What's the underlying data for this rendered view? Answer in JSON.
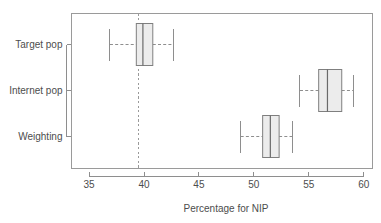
{
  "chart_data": {
    "type": "boxplot",
    "title": "",
    "xlabel": "Percentage for NIP",
    "ylabel": "",
    "orientation": "horizontal",
    "xlim": [
      33.4,
      60.8
    ],
    "xticks": [
      35,
      40,
      45,
      50,
      55,
      60
    ],
    "xticklabels": [
      "35",
      "40",
      "45",
      "50",
      "55",
      "60"
    ],
    "grid": false,
    "legend": "none",
    "categories": [
      "Target pop",
      "Internet pop",
      "Weighting"
    ],
    "reference_line": {
      "orientation": "vertical",
      "value": 39.5,
      "style": "dashed"
    },
    "boxes": [
      {
        "label": "Target pop",
        "whisker_low": 36.9,
        "q1": 39.3,
        "median": 39.9,
        "q3": 40.8,
        "whisker_high": 42.7
      },
      {
        "label": "Internet pop",
        "whisker_low": 54.2,
        "q1": 55.9,
        "median": 56.7,
        "q3": 58.0,
        "whisker_high": 59.1
      },
      {
        "label": "Weighting",
        "whisker_low": 48.8,
        "q1": 50.8,
        "median": 51.5,
        "q3": 52.3,
        "whisker_high": 53.5
      }
    ],
    "colors": {
      "box_fill": "#ececec",
      "box_stroke": "#7f7f7f",
      "median": "#6a6a6a",
      "whisker": "#8e8e8e",
      "axis": "#8e8e8e",
      "text": "#4d4d4d",
      "reference_line": "#9a9a9a",
      "background": "#ffffff"
    }
  }
}
